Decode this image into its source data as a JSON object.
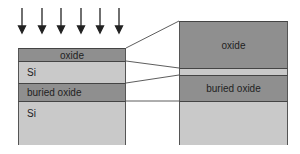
{
  "diagram": {
    "arrows": {
      "count": 6,
      "direction": "down"
    },
    "left_stack": {
      "layers": [
        {
          "label": "oxide"
        },
        {
          "label": "Si"
        },
        {
          "label": "buried oxide"
        },
        {
          "label": "Si"
        }
      ]
    },
    "right_stack": {
      "layers": [
        {
          "label": "oxide"
        },
        {
          "label": ""
        },
        {
          "label": "buried oxide"
        },
        {
          "label": ""
        }
      ]
    },
    "colors": {
      "oxide": "#8f8f8f",
      "si": "#c9c9c9",
      "lines": "#333333"
    }
  }
}
